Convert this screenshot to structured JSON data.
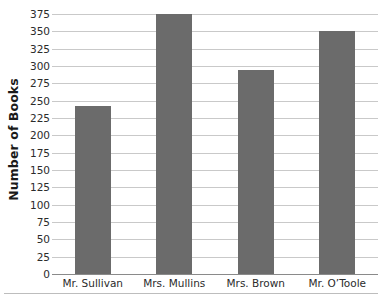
{
  "chart_data": {
    "type": "bar",
    "title": "",
    "xlabel": "",
    "ylabel": "Number of Books",
    "categories": [
      "Mr. Sullivan",
      "Mrs. Mullins",
      "Mrs. Brown",
      "Mr. O’Toole"
    ],
    "values": [
      243,
      375,
      294,
      350
    ],
    "ylim": [
      0,
      375
    ],
    "ytick_step": 25,
    "yticks": [
      375,
      350,
      325,
      300,
      275,
      250,
      225,
      200,
      175,
      150,
      125,
      100,
      75,
      50,
      25,
      0
    ],
    "ytick_labels": [
      "375",
      "350",
      "325",
      "300",
      "275",
      "250",
      "225",
      "200",
      "175",
      "150",
      "125",
      "100",
      "75",
      "50",
      "25",
      "0"
    ],
    "grid": true,
    "legend": false,
    "legend_position": "none",
    "bar_color": "#6b6b6b",
    "gridline_color": "#c9c9c9",
    "axis_color": "#8a8a8a",
    "text_color": "#2b2b2b"
  }
}
